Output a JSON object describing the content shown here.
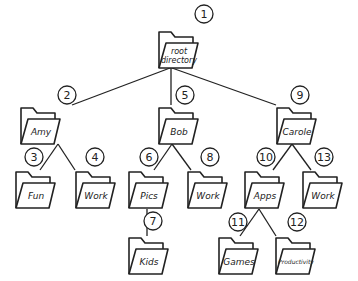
{
  "diagram": {
    "type": "directory-tree",
    "nodes": [
      {
        "id": 1,
        "label": "root directory",
        "lines": [
          "root",
          "directory"
        ],
        "x": 178,
        "y": 50,
        "badge_x": 204,
        "badge_y": 14
      },
      {
        "id": 2,
        "label": "Amy",
        "x": 40,
        "y": 126,
        "badge_x": 67,
        "badge_y": 95
      },
      {
        "id": 3,
        "label": "Fun",
        "x": 35,
        "y": 190,
        "badge_x": 34,
        "badge_y": 157
      },
      {
        "id": 4,
        "label": "Work",
        "x": 95,
        "y": 190,
        "badge_x": 95,
        "badge_y": 157
      },
      {
        "id": 5,
        "label": "Bob",
        "x": 178,
        "y": 126,
        "badge_x": 185,
        "badge_y": 95
      },
      {
        "id": 6,
        "label": "Pics",
        "x": 148,
        "y": 190,
        "badge_x": 149,
        "badge_y": 157
      },
      {
        "id": 7,
        "label": "Kids",
        "x": 148,
        "y": 256,
        "badge_x": 153,
        "badge_y": 221
      },
      {
        "id": 8,
        "label": "Work",
        "x": 207,
        "y": 190,
        "badge_x": 210,
        "badge_y": 157
      },
      {
        "id": 9,
        "label": "Carole",
        "x": 296,
        "y": 126,
        "badge_x": 300,
        "badge_y": 95
      },
      {
        "id": 10,
        "label": "Apps",
        "x": 264,
        "y": 190,
        "badge_x": 266,
        "badge_y": 157
      },
      {
        "id": 11,
        "label": "Games",
        "x": 238,
        "y": 256,
        "badge_x": 238,
        "badge_y": 222
      },
      {
        "id": 12,
        "label": "Productivity",
        "x": 295,
        "y": 256,
        "badge_x": 297,
        "badge_y": 222
      },
      {
        "id": 13,
        "label": "Work",
        "x": 322,
        "y": 190,
        "badge_x": 324,
        "badge_y": 157
      }
    ],
    "edges": [
      {
        "from": 1,
        "to": 2,
        "x1": 170,
        "y1": 68,
        "x2": 72,
        "y2": 105
      },
      {
        "from": 1,
        "to": 5,
        "x1": 171,
        "y1": 68,
        "x2": 171,
        "y2": 105
      },
      {
        "from": 1,
        "to": 9,
        "x1": 172,
        "y1": 68,
        "x2": 276,
        "y2": 105
      },
      {
        "from": 2,
        "to": 3,
        "x1": 58,
        "y1": 144,
        "x2": 40,
        "y2": 170
      },
      {
        "from": 2,
        "to": 4,
        "x1": 58,
        "y1": 144,
        "x2": 75,
        "y2": 170
      },
      {
        "from": 5,
        "to": 6,
        "x1": 172,
        "y1": 144,
        "x2": 154,
        "y2": 170
      },
      {
        "from": 5,
        "to": 8,
        "x1": 172,
        "y1": 144,
        "x2": 191,
        "y2": 170
      },
      {
        "from": 6,
        "to": 7,
        "x1": 147,
        "y1": 209,
        "x2": 147,
        "y2": 236
      },
      {
        "from": 9,
        "to": 10,
        "x1": 292,
        "y1": 144,
        "x2": 273,
        "y2": 170
      },
      {
        "from": 9,
        "to": 13,
        "x1": 292,
        "y1": 144,
        "x2": 311,
        "y2": 170
      },
      {
        "from": 10,
        "to": 11,
        "x1": 259,
        "y1": 209,
        "x2": 240,
        "y2": 236
      },
      {
        "from": 10,
        "to": 12,
        "x1": 259,
        "y1": 209,
        "x2": 276,
        "y2": 236
      }
    ]
  }
}
